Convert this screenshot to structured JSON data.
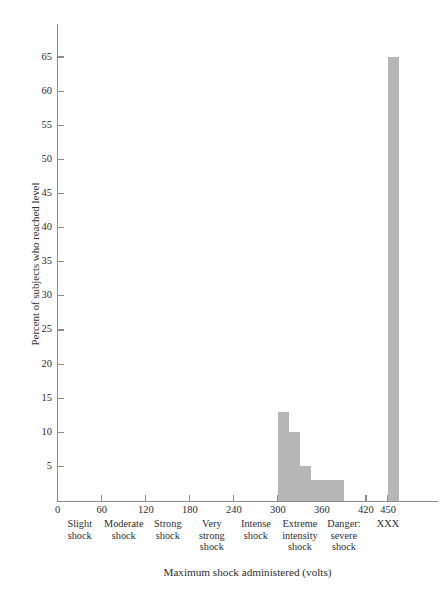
{
  "chart_data": {
    "type": "bar",
    "title": "",
    "subtitle": "",
    "xlabel": "Maximum shock administered (volts)",
    "ylabel": "Percent of subjects who reached level",
    "grid": false,
    "legend": "none",
    "xlim": [
      0,
      520
    ],
    "ylim": [
      0,
      68
    ],
    "x_tick_labels": [
      "0",
      "60",
      "120",
      "180",
      "240",
      "300",
      "360",
      "420",
      "450"
    ],
    "x_tick_values": [
      0,
      60,
      120,
      180,
      240,
      300,
      360,
      420,
      450
    ],
    "y_tick_labels": [
      "5",
      "10",
      "15",
      "20",
      "25",
      "30",
      "35",
      "40",
      "45",
      "50",
      "55",
      "60",
      "65"
    ],
    "y_tick_values": [
      5,
      10,
      15,
      20,
      25,
      30,
      35,
      40,
      45,
      50,
      55,
      60,
      65
    ],
    "category_labels": [
      "Slight\nshock",
      "Moderate\nshock",
      "Strong\nshock",
      "Very\nstrong\nshock",
      "Intense\nshock",
      "Extreme\nintensity\nshock",
      "Danger:\nsevere\nshock",
      "XXX"
    ],
    "category_centers": [
      30,
      90,
      150,
      210,
      270,
      330,
      390,
      450
    ],
    "bars": [
      {
        "x_start": 300,
        "x_end": 315,
        "value": 13
      },
      {
        "x_start": 315,
        "x_end": 330,
        "value": 10
      },
      {
        "x_start": 330,
        "x_end": 345,
        "value": 5
      },
      {
        "x_start": 345,
        "x_end": 390,
        "value": 3
      },
      {
        "x_start": 450,
        "x_end": 465,
        "value": 65
      }
    ],
    "bar_color": "#b6b6b6",
    "axis_color": "#8c8c8c",
    "text_color": "#2e2e2e",
    "categories": [
      "300-315",
      "315-330",
      "330-345",
      "345-390",
      "450-465"
    ],
    "values": [
      13,
      10,
      5,
      3,
      65
    ]
  }
}
